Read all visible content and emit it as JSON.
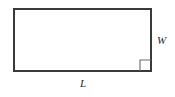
{
  "figure": {
    "type": "geometry-diagram",
    "shape": "rectangle",
    "background_color": "#ffffff",
    "outline_color": "#3a3a3a",
    "outline_width_px": 2,
    "fill_color": "#ffffff",
    "rectangle": {
      "x": 13,
      "y": 8,
      "width": 139,
      "height": 64
    },
    "right_angle_marker": {
      "name": "right-angle-mark",
      "corner": "bottom-right",
      "size_px": 11,
      "color": "#6b6b6b",
      "stroke_width_px": 1
    },
    "labels": {
      "length": {
        "text": "L",
        "position": "below-bottom-edge",
        "style": "italic-serif",
        "color": "#2b2b2b"
      },
      "width": {
        "text": "W",
        "position": "right-of-right-edge",
        "style": "italic-serif",
        "color": "#2b2b2b"
      }
    }
  }
}
